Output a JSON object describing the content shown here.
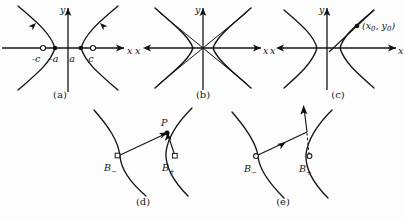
{
  "figure": {
    "background_color": "#fdfdfd",
    "ink_color": "#151515",
    "width": 405,
    "height": 220
  },
  "panels": [
    {
      "id": "a",
      "caption": "(a)",
      "description": "Hyperbola with foci and vertices marked on the x-axis",
      "axes": {
        "x_label": "x",
        "y_label": "y"
      },
      "markers": [
        {
          "name": "focus-left",
          "label": "-c",
          "style": "open-circle"
        },
        {
          "name": "vertex-left",
          "label": "-a",
          "style": "filled-dot"
        },
        {
          "name": "vertex-right",
          "label": "a",
          "style": "filled-dot"
        },
        {
          "name": "focus-right",
          "label": "c",
          "style": "open-circle"
        }
      ]
    },
    {
      "id": "b",
      "caption": "(b)",
      "description": "Hyperbola branches approaching crossed asymptotes",
      "axes": {
        "x_label_left": "x",
        "x_label_right": "x",
        "y_label": "y"
      },
      "markers": []
    },
    {
      "id": "c",
      "caption": "(c)",
      "description": "Hyperbola with a tangent line touching the right branch",
      "axes": {
        "x_label_left": "x",
        "x_label_right": "x",
        "y_label": "y"
      },
      "point_label": "(x",
      "point_sub_1": "0",
      "point_sep": ", y",
      "point_sub_2": "0",
      "point_close": ")",
      "markers": [
        {
          "name": "tangent-point",
          "label": "(x0, y0)",
          "style": "filled-dot"
        }
      ]
    },
    {
      "id": "d",
      "caption": "(d)",
      "description": "Point P on the right branch with segments drawn from the two foci",
      "labels": {
        "point_p": "P",
        "focus_minus": "B",
        "focus_minus_sub": "−",
        "focus_plus": "B",
        "focus_plus_sub": "+"
      }
    },
    {
      "id": "e",
      "caption": "(e)",
      "description": "Ray from B-minus reflecting off the branch, dashed line toward B-plus",
      "labels": {
        "focus_minus": "B",
        "focus_minus_sub": "−",
        "focus_plus": "B",
        "focus_plus_sub": "+"
      }
    }
  ]
}
